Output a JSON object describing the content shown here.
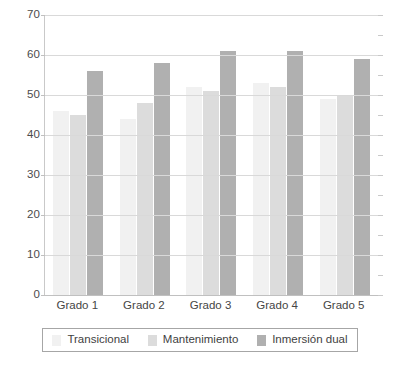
{
  "chart_data": {
    "type": "bar",
    "title": "",
    "subtitle": "",
    "xlabel": "",
    "ylabel": "",
    "categories": [
      "Grado 1",
      "Grado 2",
      "Grado 3",
      "Grado 4",
      "Grado 5"
    ],
    "series": [
      {
        "name": "Transicional",
        "color": "#f1f1f1",
        "values": [
          46,
          44,
          52,
          53,
          49
        ]
      },
      {
        "name": "Mantenimiento",
        "color": "#dcdcdc",
        "values": [
          45,
          48,
          51,
          52,
          50
        ]
      },
      {
        "name": "Inmersión dual",
        "color": "#b0b0b0",
        "values": [
          56,
          58,
          61,
          61,
          59
        ]
      }
    ],
    "ylim": [
      0,
      70
    ],
    "ytick_step": 10,
    "yticks": [
      0,
      10,
      20,
      30,
      40,
      50,
      60,
      70
    ],
    "ytick_labels": [
      "0",
      "10",
      "20",
      "30",
      "40",
      "50",
      "60",
      "70"
    ],
    "grid": true,
    "grid_axis": "y",
    "legend": true,
    "legend_position": "bottom",
    "legend_entries": [
      "Transicional",
      "Mantenimiento",
      "Inmersión dual"
    ],
    "background_color": "#ffffff",
    "gridline_color": "#d9d9d9",
    "axis_color": "#c0c0c0",
    "tick_label_color": "#4c4c4c"
  }
}
